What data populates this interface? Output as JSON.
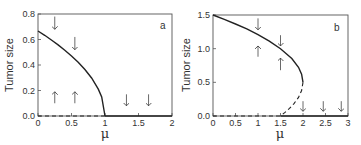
{
  "chart_data": [
    {
      "type": "line",
      "panel_label": "a",
      "xlabel": "μ",
      "ylabel": "Tumor size",
      "xlim": [
        0,
        2
      ],
      "ylim": [
        0,
        0.8
      ],
      "xticks": [
        0,
        0.5,
        1,
        1.5,
        2
      ],
      "xtick_labels": [
        "0",
        "0.5",
        "1",
        "1.5",
        "2"
      ],
      "yticks": [
        0,
        0.2,
        0.4,
        0.6,
        0.8
      ],
      "ytick_labels": [
        "0.0",
        "0.2",
        "0.4",
        "0.6",
        "0.8"
      ],
      "grid": false,
      "series": [
        {
          "name": "stable branch",
          "style": "solid",
          "x": [
            0,
            0.1,
            0.2,
            0.3,
            0.4,
            0.5,
            0.6,
            0.7,
            0.8,
            0.9,
            0.95,
            1.0
          ],
          "y": [
            0.667,
            0.633,
            0.596,
            0.558,
            0.516,
            0.471,
            0.422,
            0.365,
            0.298,
            0.211,
            0.149,
            0.0
          ]
        },
        {
          "name": "unstable zero state",
          "style": "dashed",
          "x": [
            0,
            1
          ],
          "y": [
            0,
            0
          ]
        },
        {
          "name": "stable zero state",
          "style": "solid",
          "x": [
            1,
            2
          ],
          "y": [
            0,
            0
          ]
        }
      ],
      "arrows": [
        {
          "x": 0.25,
          "y_from": 0.78,
          "y_to": 0.68,
          "dir": "down"
        },
        {
          "x": 0.55,
          "y_from": 0.62,
          "y_to": 0.52,
          "dir": "down"
        },
        {
          "x": 0.25,
          "y_from": 0.1,
          "y_to": 0.19,
          "dir": "up"
        },
        {
          "x": 0.55,
          "y_from": 0.1,
          "y_to": 0.19,
          "dir": "up"
        },
        {
          "x": 1.32,
          "y_from": 0.17,
          "y_to": 0.08,
          "dir": "down"
        },
        {
          "x": 1.65,
          "y_from": 0.17,
          "y_to": 0.08,
          "dir": "down"
        }
      ]
    },
    {
      "type": "line",
      "panel_label": "b",
      "xlabel": "μ",
      "ylabel": "Tumor size",
      "xlim": [
        0,
        3
      ],
      "ylim": [
        0,
        1.5
      ],
      "xticks": [
        0,
        0.5,
        1,
        1.5,
        2,
        2.5,
        3
      ],
      "xtick_labels": [
        "0",
        "0.5",
        "1",
        "1.5",
        "2",
        "2.5",
        "3"
      ],
      "yticks": [
        0,
        0.5,
        1.0,
        1.5
      ],
      "ytick_labels": [
        "0.0",
        "0.5",
        "1.0",
        "1.5"
      ],
      "grid": false,
      "series": [
        {
          "name": "stable upper branch",
          "style": "solid",
          "x": [
            0,
            0.25,
            0.5,
            0.75,
            1.0,
            1.25,
            1.5,
            1.75,
            1.9,
            1.97,
            2.0
          ],
          "y": [
            1.5,
            1.435,
            1.366,
            1.293,
            1.207,
            1.112,
            1.0,
            0.854,
            0.724,
            0.621,
            0.5
          ]
        },
        {
          "name": "unstable lower branch",
          "style": "dashed",
          "x": [
            2.0,
            1.97,
            1.9,
            1.8,
            1.7,
            1.6,
            1.5
          ],
          "y": [
            0.5,
            0.379,
            0.276,
            0.184,
            0.113,
            0.053,
            0.0
          ]
        },
        {
          "name": "zero state",
          "style": "dashed",
          "x": [
            0,
            1.5
          ],
          "y": [
            0,
            0
          ]
        },
        {
          "name": "zero state stable",
          "style": "solid",
          "x": [
            1.5,
            3
          ],
          "y": [
            0,
            0
          ]
        }
      ],
      "arrows": [
        {
          "x": 1.0,
          "y_from": 1.45,
          "y_to": 1.28,
          "dir": "down"
        },
        {
          "x": 1.5,
          "y_from": 1.2,
          "y_to": 1.04,
          "dir": "down"
        },
        {
          "x": 1.0,
          "y_from": 0.88,
          "y_to": 1.04,
          "dir": "up"
        },
        {
          "x": 1.5,
          "y_from": 0.68,
          "y_to": 0.86,
          "dir": "up"
        },
        {
          "x": 2.0,
          "y_from": 0.22,
          "y_to": 0.07,
          "dir": "down"
        },
        {
          "x": 2.45,
          "y_from": 0.22,
          "y_to": 0.07,
          "dir": "down"
        },
        {
          "x": 2.85,
          "y_from": 0.22,
          "y_to": 0.07,
          "dir": "down"
        }
      ]
    }
  ],
  "panels": [
    {
      "label": "a",
      "ylabel": "Tumor size",
      "xlabel": "μ"
    },
    {
      "label": "b",
      "ylabel": "Tumor size",
      "xlabel": "μ"
    }
  ]
}
